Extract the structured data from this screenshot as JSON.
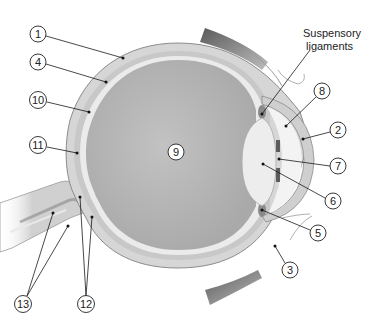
{
  "diagram": {
    "colors": {
      "background": "#ffffff",
      "sclera": "#d6d6d6",
      "sclera_outline": "#8c8c8c",
      "choroid": "#c4c4c4",
      "retina": "#e4e4e4",
      "vitreous": "#b3b3b3",
      "lens": "#ececec",
      "cornea": "#dcdcdc",
      "aqueous": "#f2f2f2",
      "iris": "#6e6e6e",
      "muscle": "#9a9a9a",
      "leader": "#1a1a1a"
    },
    "text_labels": [
      {
        "id": "suspensory",
        "line1": "Suspensory",
        "line2": "ligaments"
      }
    ],
    "callouts": [
      {
        "n": "1",
        "cx": 38,
        "cy": 34
      },
      {
        "n": "4",
        "cx": 38,
        "cy": 62
      },
      {
        "n": "10",
        "cx": 38,
        "cy": 100
      },
      {
        "n": "11",
        "cx": 38,
        "cy": 145
      },
      {
        "n": "9",
        "cx": 176,
        "cy": 152
      },
      {
        "n": "8",
        "cx": 322,
        "cy": 91
      },
      {
        "n": "2",
        "cx": 338,
        "cy": 130
      },
      {
        "n": "7",
        "cx": 338,
        "cy": 166
      },
      {
        "n": "6",
        "cx": 333,
        "cy": 201
      },
      {
        "n": "5",
        "cx": 318,
        "cy": 233
      },
      {
        "n": "3",
        "cx": 290,
        "cy": 270
      },
      {
        "n": "13",
        "cx": 23,
        "cy": 304
      },
      {
        "n": "12",
        "cx": 86,
        "cy": 304
      }
    ]
  }
}
